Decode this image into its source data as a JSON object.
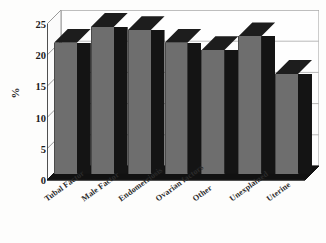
{
  "chart_data": {
    "type": "bar",
    "title": "",
    "xlabel": "",
    "ylabel": "%",
    "ylim": [
      0,
      25
    ],
    "yticks": [
      0,
      5,
      10,
      15,
      20,
      25
    ],
    "grid": true,
    "legend": "none",
    "style": "3d-column",
    "categories": [
      "Tubal Factor",
      "Male Factor",
      "Endometriosis",
      "Ovarian factors",
      "Other",
      "Unexplained",
      "Uterine"
    ],
    "values": [
      21,
      23.5,
      23,
      21,
      19.8,
      22,
      16
    ],
    "bar_color": "#6e6e6e",
    "bar_side_color": "#141414",
    "bar_top_color": "#1d1d1d",
    "axis_color": "#1c1c1c",
    "grid_color": "#b8b8b8",
    "background": "#fdfdfc"
  },
  "axis": {
    "y_title": "%",
    "tick_labels": [
      "0",
      "5",
      "10",
      "15",
      "20",
      "25"
    ]
  }
}
